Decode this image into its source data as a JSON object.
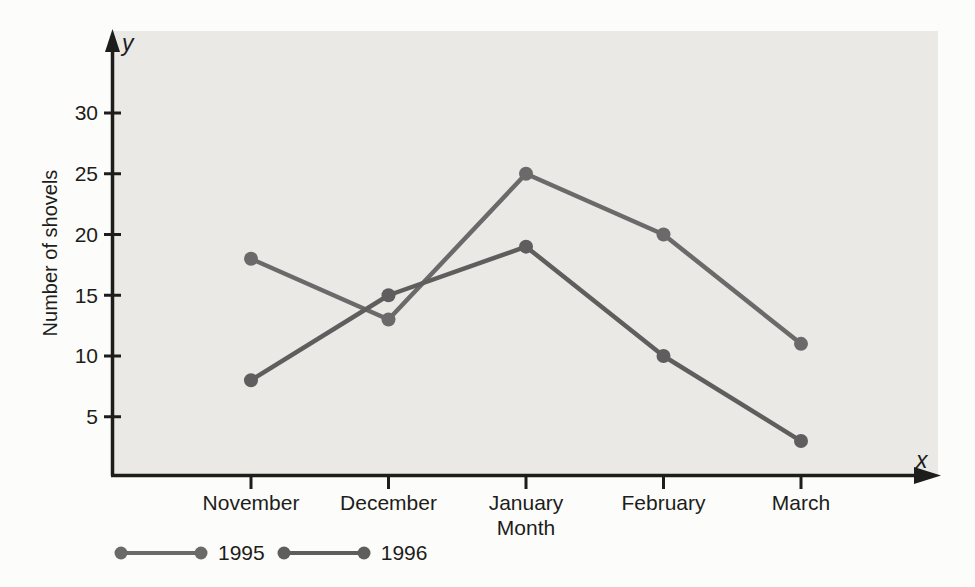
{
  "chart_data": {
    "type": "line",
    "title": "",
    "categories": [
      "November",
      "December",
      "January",
      "February",
      "March"
    ],
    "series": [
      {
        "name": "1995",
        "values": [
          18,
          13,
          25,
          20,
          11
        ],
        "color": "#6a6a6a"
      },
      {
        "name": "1996",
        "values": [
          8,
          15,
          19,
          10,
          3
        ],
        "color": "#5e5e5e"
      }
    ],
    "xlabel": "Month",
    "ylabel": "Number of shovels",
    "x_axis_symbol": "x",
    "y_axis_symbol": "y",
    "y_ticks": [
      5,
      10,
      15,
      20,
      25,
      30
    ],
    "ylim": [
      0,
      36
    ],
    "grid": false,
    "legend_position": "bottom-left",
    "marker": "circle",
    "colors": {
      "plot_bg": "#eae9e5",
      "axis": "#1d1d1b",
      "text": "#1d1d1b",
      "page_bg": "#fcfcfa"
    }
  }
}
